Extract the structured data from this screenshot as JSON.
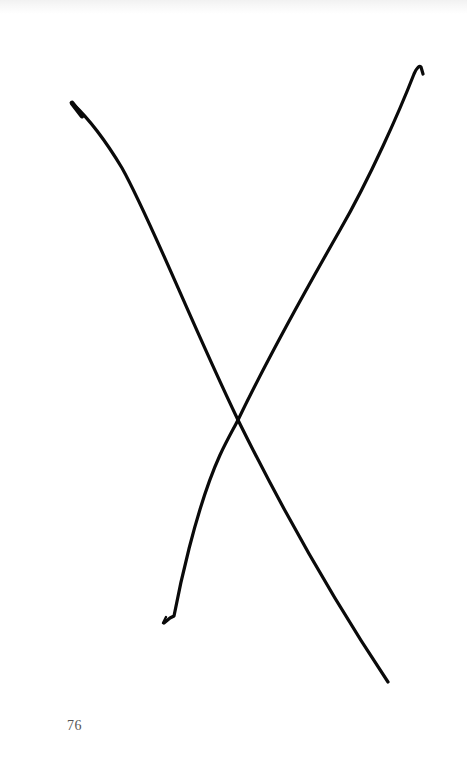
{
  "page": {
    "number": "76",
    "background_color": "#ffffff",
    "ink_color": "#0a0a0a",
    "page_number_color": "#555555"
  },
  "illustration": {
    "type": "hand-drawn X",
    "strokes": [
      {
        "name": "descending-stroke",
        "start": [
          73,
          104
        ],
        "end": [
          388,
          682
        ]
      },
      {
        "name": "ascending-stroke",
        "start": [
          164,
          623
        ],
        "end": [
          421,
          67
        ]
      }
    ],
    "intersection": [
      238,
      420
    ]
  }
}
